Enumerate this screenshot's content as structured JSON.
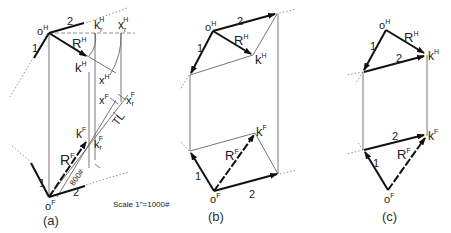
{
  "figure": {
    "panels": [
      {
        "id": "a",
        "caption": "(a)",
        "labels": {
          "oH": "o",
          "oH_sup": "H",
          "kH": "k",
          "kH_sup": "H",
          "RH": "R",
          "RH_sup": "H",
          "krH": "k",
          "krH_sub": "r",
          "krH_sup": "H",
          "xrH": "x",
          "xrH_sub": "r",
          "xrH_sup": "H",
          "xH": "x",
          "xH_sup": "H",
          "xF": "x",
          "xF_sup": "F",
          "xrF": "x",
          "xrF_sub": "r",
          "xrF_sup": "F",
          "TL": "TL",
          "kF": "k",
          "kF_sup": "F",
          "krF": "k",
          "krF_sub": "r",
          "krF_sup": "F",
          "RF": "R",
          "RF_sup": "F",
          "length": "800#",
          "oF": "o",
          "oF_sup": "F",
          "vec1": "1",
          "vec2_top": "2",
          "vec2_bottom": "2"
        }
      },
      {
        "id": "b",
        "caption": "(b)",
        "labels": {
          "oH": "o",
          "oH_sup": "H",
          "RH": "R",
          "RH_sup": "H",
          "kH": "k",
          "kH_sup": "H",
          "vec1_top": "1",
          "vec2_top": "2",
          "kF": "k",
          "kF_sup": "F",
          "RF": "R",
          "RF_sup": "F",
          "vec1_bottom": "1",
          "vec2_bottom": "2",
          "oF": "o",
          "oF_sup": "F"
        }
      },
      {
        "id": "c",
        "caption": "(c)",
        "labels": {
          "oH": "o",
          "oH_sup": "H",
          "RH": "R",
          "RH_sup": "H",
          "kH": "k",
          "kH_sup": "H",
          "vec1_top": "1",
          "vec2_top": "2",
          "kF": "k",
          "kF_sup": "F",
          "vec2_bottom": "2",
          "RF": "R",
          "RF_sup": "F",
          "vec1_bottom": "1",
          "oF": "o",
          "oF_sup": "F"
        }
      }
    ],
    "scale_note": "Scale 1\"=1000#"
  }
}
